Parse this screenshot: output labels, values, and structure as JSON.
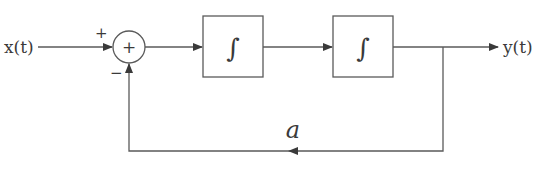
{
  "diagram": {
    "type": "block-diagram",
    "input_label": "x(t)",
    "output_label": "y(t)",
    "summer": {
      "symbol": "+",
      "top_input_sign": "+",
      "bottom_input_sign": "−"
    },
    "blocks": [
      {
        "id": "integrator-1",
        "symbol": "∫"
      },
      {
        "id": "integrator-2",
        "symbol": "∫"
      }
    ],
    "feedback": {
      "gain_label": "a"
    },
    "colors": {
      "line": "#5a5a5a",
      "text": "#3a3a3a",
      "background": "#ffffff"
    }
  }
}
